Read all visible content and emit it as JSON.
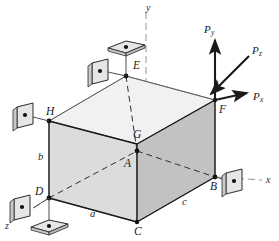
{
  "figure": {
    "body_shape": "rectangular-box",
    "colors": {
      "line": "#1a1a1a",
      "thin_line": "#55555a",
      "hidden_line": "#3a3a3a",
      "face_top": "#f0f0f0",
      "face_left": "#d9d9d9",
      "face_right": "#bfbfbf",
      "support_plate_fill": "#e2e2e2",
      "support_plate_edge": "#2a2a2a",
      "axis_line": "#7a7a7a",
      "background": "#ffffff"
    }
  },
  "axes": [
    {
      "name": "y-axis",
      "label": "y",
      "x": 146,
      "y": 3
    },
    {
      "name": "x-axis",
      "label": "x",
      "x": 266,
      "y": 181
    },
    {
      "name": "z-axis",
      "label": "z",
      "x": 5,
      "y": 226
    }
  ],
  "vertices": [
    {
      "name": "A",
      "label": "A",
      "x": 124,
      "y": 158,
      "px": 120,
      "py": 151,
      "hidden": true
    },
    {
      "name": "B",
      "label": "B",
      "x": 210,
      "y": 189,
      "px": 215,
      "py": 177,
      "hidden": false
    },
    {
      "name": "C",
      "label": "C",
      "x": 136,
      "y": 228,
      "px": 137,
      "py": 222,
      "hidden": false
    },
    {
      "name": "D",
      "label": "D",
      "x": 34,
      "y": 186,
      "px": 49,
      "py": 198,
      "hidden": false
    },
    {
      "name": "E",
      "label": "E",
      "x": 134,
      "y": 60,
      "px": 126,
      "py": 76,
      "hidden": false
    },
    {
      "name": "F",
      "label": "F",
      "x": 219,
      "y": 109,
      "px": 215,
      "py": 100,
      "hidden": false
    },
    {
      "name": "G",
      "label": "G",
      "x": 132,
      "y": 128,
      "px": 137,
      "py": 144,
      "hidden": false
    },
    {
      "name": "H",
      "label": "H",
      "x": 46,
      "y": 108,
      "px": 49,
      "py": 121,
      "hidden": false
    }
  ],
  "dimensions": [
    {
      "name": "dimension-b",
      "label": "b",
      "x": 38,
      "y": 154
    },
    {
      "name": "dimension-a",
      "label": "a",
      "x": 90,
      "y": 213
    },
    {
      "name": "dimension-c",
      "label": "c",
      "x": 182,
      "y": 201
    }
  ],
  "forces": [
    {
      "name": "force-Py",
      "base": "P",
      "sub": "y",
      "x": 205,
      "y": 26,
      "direction": "up-along-y"
    },
    {
      "name": "force-Pz",
      "base": "P",
      "sub": "z",
      "x": 253,
      "y": 48,
      "direction": "toward-origin-along-z"
    },
    {
      "name": "force-Px",
      "base": "P",
      "sub": "x",
      "x": 254,
      "y": 96,
      "direction": "positive-x"
    }
  ],
  "supports": [
    {
      "name": "support-plate-above-E",
      "type": "horizontal-plate",
      "x": 126,
      "y": 48
    },
    {
      "name": "support-plate-behind-E",
      "type": "vertical-plate",
      "x": 100,
      "y": 70
    },
    {
      "name": "support-plate-at-H",
      "type": "vertical-plate",
      "x": 25,
      "y": 114
    },
    {
      "name": "support-plate-at-D",
      "type": "vertical-plate",
      "x": 22,
      "y": 206
    },
    {
      "name": "support-plate-below-D",
      "type": "horizontal-plate",
      "x": 49,
      "y": 227
    },
    {
      "name": "support-plate-at-B",
      "type": "vertical-plate",
      "x": 231,
      "y": 180
    }
  ]
}
